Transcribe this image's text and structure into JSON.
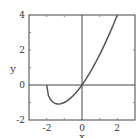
{
  "chart_data": {
    "type": "line",
    "title": "",
    "xlabel": "x",
    "ylabel": "y",
    "xlim": [
      -3,
      3
    ],
    "ylim": [
      -2,
      4
    ],
    "xticks": [
      -2,
      0,
      2
    ],
    "yticks": [
      -2,
      0,
      2,
      4
    ],
    "xtick_labels": [
      "-2",
      "0",
      "2"
    ],
    "ytick_labels": [
      "-2",
      "0",
      "2",
      "4"
    ],
    "grid": false,
    "axes_lines_at_zero": true,
    "series": [
      {
        "name": "y = x·sqrt(x+2)",
        "x": [
          -2,
          -1.9,
          -1.8,
          -1.7,
          -1.6,
          -1.5,
          -1.4,
          -1.333,
          -1.2,
          -1.0,
          -0.8,
          -0.6,
          -0.4,
          -0.2,
          0,
          0.25,
          0.5,
          0.75,
          1.0,
          1.25,
          1.5,
          1.75,
          2.0
        ],
        "y": [
          0,
          -0.601,
          -0.805,
          -0.931,
          -1.012,
          -1.061,
          -1.084,
          -1.089,
          -1.073,
          -1.0,
          -0.876,
          -0.71,
          -0.506,
          -0.268,
          0,
          0.375,
          0.791,
          1.244,
          1.732,
          2.253,
          2.806,
          3.389,
          4.0
        ]
      }
    ],
    "color": "#555555"
  }
}
